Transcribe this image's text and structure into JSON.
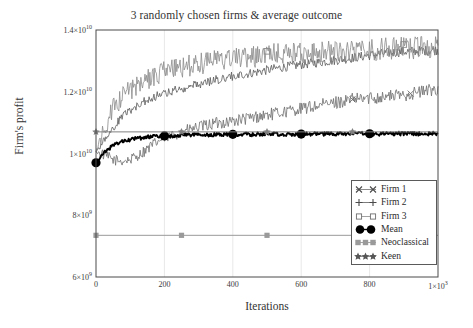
{
  "chart_data": {
    "type": "line",
    "title": "3 randomly chosen firms & average outcome",
    "xlabel": "Iterations",
    "ylabel": "Firm's profit",
    "xlim": [
      0,
      1000
    ],
    "ylim": [
      6000000000,
      14000000000
    ],
    "grid": "vertical-faint",
    "legend_position": "bottom-right-inside",
    "xticks": [
      {
        "value": 0,
        "label": "0"
      },
      {
        "value": 200,
        "label": "200"
      },
      {
        "value": 400,
        "label": "400"
      },
      {
        "value": 600,
        "label": "600"
      },
      {
        "value": 800,
        "label": "800"
      },
      {
        "value": 1000,
        "label": "1×10",
        "exp": "3"
      }
    ],
    "yticks": [
      {
        "value": 14000000000,
        "label": "1.4×10",
        "exp": "10"
      },
      {
        "value": 12000000000,
        "label": "1.2×10",
        "exp": "10"
      },
      {
        "value": 10000000000,
        "label": "1×10",
        "exp": "10"
      },
      {
        "value": 8000000000,
        "label": "8×10",
        "exp": "9"
      },
      {
        "value": 6000000000,
        "label": "6×10",
        "exp": "9"
      }
    ],
    "x": [
      0,
      25,
      50,
      75,
      100,
      125,
      150,
      175,
      200,
      250,
      300,
      350,
      400,
      450,
      500,
      550,
      600,
      650,
      700,
      750,
      800,
      850,
      900,
      950,
      1000
    ],
    "series": [
      {
        "name": "Firm 1",
        "marker": "x-cross",
        "color": "#6e6e6e",
        "noise": 0.018,
        "values": [
          10050000000,
          9950000000,
          9800000000,
          9750000000,
          9800000000,
          9950000000,
          10150000000,
          10350000000,
          10500000000,
          10700000000,
          10850000000,
          10980000000,
          11050000000,
          11150000000,
          11250000000,
          11350000000,
          11450000000,
          11550000000,
          11650000000,
          11750000000,
          11800000000,
          11850000000,
          11900000000,
          12000000000,
          12100000000
        ]
      },
      {
        "name": "Firm 2",
        "marker": "plus",
        "color": "#5a5a5a",
        "noise": 0.012,
        "values": [
          10050000000,
          10450000000,
          10850000000,
          11150000000,
          11400000000,
          11600000000,
          11750000000,
          11850000000,
          11950000000,
          12100000000,
          12250000000,
          12380000000,
          12500000000,
          12600000000,
          12700000000,
          12800000000,
          12880000000,
          12950000000,
          13020000000,
          13100000000,
          13180000000,
          13250000000,
          13300000000,
          13330000000,
          13350000000
        ]
      },
      {
        "name": "Firm 3",
        "marker": "square-open",
        "color": "#8a8a8a",
        "noise": 0.028,
        "values": [
          10050000000,
          10800000000,
          11450000000,
          11800000000,
          12050000000,
          12250000000,
          12400000000,
          12550000000,
          12650000000,
          12800000000,
          12900000000,
          13000000000,
          13050000000,
          13120000000,
          13180000000,
          13220000000,
          13250000000,
          13280000000,
          13300000000,
          13320000000,
          13350000000,
          13380000000,
          13400000000,
          13420000000,
          13420000000
        ]
      },
      {
        "name": "Mean",
        "marker": "circle-filled",
        "color": "#000000",
        "noise": 0.006,
        "marker_x": [
          0,
          200,
          400,
          600,
          800
        ],
        "values": [
          9700000000,
          10050000000,
          10250000000,
          10380000000,
          10450000000,
          10500000000,
          10530000000,
          10550000000,
          10570000000,
          10590000000,
          10600000000,
          10610000000,
          10620000000,
          10620000000,
          10625000000,
          10630000000,
          10630000000,
          10635000000,
          10635000000,
          10640000000,
          10640000000,
          10640000000,
          10645000000,
          10645000000,
          10645000000
        ]
      },
      {
        "name": "Neoclassical",
        "marker": "square-filled",
        "color": "#9a9a9a",
        "constant": 7350000000,
        "marker_x": [
          0,
          250,
          500
        ]
      },
      {
        "name": "Keen",
        "marker": "star",
        "color": "#808080",
        "constant": 10700000000,
        "marker_x": [
          0,
          250,
          500,
          750
        ]
      }
    ]
  },
  "legend": {
    "entries": [
      {
        "label": "Firm 1",
        "icon": "x-cross-marker-icon"
      },
      {
        "label": "Firm 2",
        "icon": "plus-marker-icon"
      },
      {
        "label": "Firm 3",
        "icon": "square-open-marker-icon"
      },
      {
        "label": "Mean",
        "icon": "filled-circle-marker-icon"
      },
      {
        "label": "Neoclassical",
        "icon": "filled-square-marker-icon"
      },
      {
        "label": "Keen",
        "icon": "star-marker-icon"
      }
    ]
  }
}
